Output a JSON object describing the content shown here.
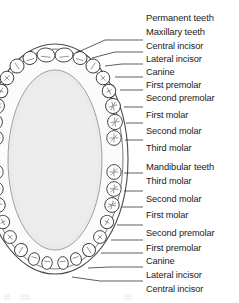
{
  "figure": {
    "type": "dental-arch-occlusal-diagram",
    "palate_fill": "#eaeaea",
    "tooth_fill": "#ffffff",
    "outline_color": "#3a3a3a",
    "text_color": "#1a1a1a",
    "leader_color": "#2a2a2a"
  },
  "labels": [
    {
      "id": "permanent-teeth",
      "text": "Permanent teeth",
      "x": 146,
      "y": 13,
      "group": true,
      "leader": false
    },
    {
      "id": "maxillary-teeth",
      "text": "Maxillary teeth",
      "x": 146,
      "y": 27,
      "group": true,
      "leader": false
    },
    {
      "id": "max-central-incisor",
      "text": "Central incisor",
      "x": 146,
      "y": 41,
      "group": false,
      "leader": true
    },
    {
      "id": "max-lateral-incisor",
      "text": "Lateral incisor",
      "x": 146,
      "y": 54,
      "group": false,
      "leader": true
    },
    {
      "id": "max-canine",
      "text": "Canine",
      "x": 146,
      "y": 67,
      "group": false,
      "leader": true
    },
    {
      "id": "max-first-premolar",
      "text": "First premolar",
      "x": 146,
      "y": 80,
      "group": false,
      "leader": true
    },
    {
      "id": "max-second-premolar",
      "text": "Second premolar",
      "x": 146,
      "y": 93,
      "group": false,
      "leader": true
    },
    {
      "id": "max-first-molar",
      "text": "First molar",
      "x": 146,
      "y": 110,
      "group": false,
      "leader": true
    },
    {
      "id": "max-second-molar",
      "text": "Second molar",
      "x": 146,
      "y": 126,
      "group": false,
      "leader": true
    },
    {
      "id": "max-third-molar",
      "text": "Third molar",
      "x": 146,
      "y": 143,
      "group": false,
      "leader": true
    },
    {
      "id": "mandibular-teeth",
      "text": "Mandibular teeth",
      "x": 146,
      "y": 162,
      "group": true,
      "leader": false
    },
    {
      "id": "man-third-molar",
      "text": "Third molar",
      "x": 146,
      "y": 176,
      "group": false,
      "leader": true
    },
    {
      "id": "man-second-molar",
      "text": "Second molar",
      "x": 146,
      "y": 194,
      "group": false,
      "leader": true
    },
    {
      "id": "man-first-molar",
      "text": "First molar",
      "x": 146,
      "y": 210,
      "group": false,
      "leader": true
    },
    {
      "id": "man-second-premolar",
      "text": "Second premolar",
      "x": 146,
      "y": 228,
      "group": false,
      "leader": true
    },
    {
      "id": "man-first-premolar",
      "text": "First premolar",
      "x": 146,
      "y": 243,
      "group": false,
      "leader": true
    },
    {
      "id": "man-canine",
      "text": "Canine",
      "x": 146,
      "y": 256,
      "group": false,
      "leader": true
    },
    {
      "id": "man-lateral-incisor",
      "text": "Lateral incisor",
      "x": 146,
      "y": 270,
      "group": false,
      "leader": true
    },
    {
      "id": "man-central-incisor",
      "text": "Central incisor",
      "x": 146,
      "y": 284,
      "group": false,
      "leader": true
    }
  ],
  "leader_lines": [
    {
      "id": "leader-max-central-incisor",
      "x1": 76,
      "y1": 53,
      "x2": 105,
      "y2": 40,
      "x3": 143,
      "y3": 40
    },
    {
      "id": "leader-max-lateral-incisor",
      "x1": 92,
      "y1": 58,
      "x2": 115,
      "y2": 52,
      "x3": 143,
      "y3": 52
    },
    {
      "id": "leader-max-canine",
      "x1": 105,
      "y1": 66,
      "x2": 122,
      "y2": 64,
      "x3": 143,
      "y3": 64
    },
    {
      "id": "leader-max-first-premolar",
      "x1": 115,
      "y1": 77,
      "x2": 130,
      "y2": 77,
      "x3": 143,
      "y3": 77
    },
    {
      "id": "leader-max-second-premolar",
      "x1": 120,
      "y1": 90,
      "x2": 133,
      "y2": 90,
      "x3": 143,
      "y3": 90
    },
    {
      "id": "leader-max-first-molar",
      "x1": 124,
      "y1": 107,
      "x2": 134,
      "y2": 107,
      "x3": 143,
      "y3": 107
    },
    {
      "id": "leader-max-second-molar",
      "x1": 126,
      "y1": 123,
      "x2": 134,
      "y2": 123,
      "x3": 143,
      "y3": 123
    },
    {
      "id": "leader-max-third-molar",
      "x1": 125,
      "y1": 140,
      "x2": 134,
      "y2": 140,
      "x3": 143,
      "y3": 140
    },
    {
      "id": "leader-man-third-molar",
      "x1": 124,
      "y1": 173,
      "x2": 134,
      "y2": 173,
      "x3": 143,
      "y3": 173
    },
    {
      "id": "leader-man-second-molar",
      "x1": 124,
      "y1": 191,
      "x2": 134,
      "y2": 191,
      "x3": 143,
      "y3": 191
    },
    {
      "id": "leader-man-first-molar",
      "x1": 122,
      "y1": 207,
      "x2": 134,
      "y2": 207,
      "x3": 143,
      "y3": 207
    },
    {
      "id": "leader-man-second-premolar",
      "x1": 117,
      "y1": 225,
      "x2": 132,
      "y2": 225,
      "x3": 143,
      "y3": 225
    },
    {
      "id": "leader-man-first-premolar",
      "x1": 111,
      "y1": 240,
      "x2": 128,
      "y2": 240,
      "x3": 143,
      "y3": 240
    },
    {
      "id": "leader-man-canine",
      "x1": 101,
      "y1": 253,
      "x2": 120,
      "y2": 253,
      "x3": 143,
      "y3": 253
    },
    {
      "id": "leader-man-lateral-incisor",
      "x1": 88,
      "y1": 268,
      "x2": 110,
      "y2": 267,
      "x3": 143,
      "y3": 267
    },
    {
      "id": "leader-man-central-incisor",
      "x1": 72,
      "y1": 277,
      "x2": 100,
      "y2": 281,
      "x3": 143,
      "y3": 281
    }
  ],
  "teeth": {
    "maxillary_right": [
      {
        "id": "tooth-max-r-central-incisor",
        "cx": 64,
        "cy": 55,
        "rx": 9.0,
        "ry": 7.0,
        "rot": -6,
        "type": "incisor"
      },
      {
        "id": "tooth-max-r-lateral-incisor",
        "cx": 80,
        "cy": 58,
        "rx": 7.0,
        "ry": 6.5,
        "rot": 16,
        "type": "incisor"
      },
      {
        "id": "tooth-max-r-canine",
        "cx": 93,
        "cy": 66,
        "rx": 7.0,
        "ry": 7.0,
        "rot": 33,
        "type": "canine"
      },
      {
        "id": "tooth-max-r-first-premolar",
        "cx": 103,
        "cy": 78,
        "rx": 6.8,
        "ry": 6.8,
        "rot": 48,
        "type": "premolar"
      },
      {
        "id": "tooth-max-r-second-premolar",
        "cx": 109,
        "cy": 91,
        "rx": 6.8,
        "ry": 6.8,
        "rot": 62,
        "type": "premolar"
      },
      {
        "id": "tooth-max-r-first-molar",
        "cx": 113,
        "cy": 106,
        "rx": 7.6,
        "ry": 7.4,
        "rot": 74,
        "type": "molar"
      },
      {
        "id": "tooth-max-r-second-molar",
        "cx": 115,
        "cy": 122,
        "rx": 7.6,
        "ry": 7.4,
        "rot": 83,
        "type": "molar"
      },
      {
        "id": "tooth-max-r-third-molar",
        "cx": 114,
        "cy": 138,
        "rx": 7.4,
        "ry": 7.2,
        "rot": 90,
        "type": "molar"
      }
    ],
    "maxillary_left": [
      {
        "id": "tooth-max-l-central-incisor",
        "cx": 46,
        "cy": 55,
        "rx": 9.0,
        "ry": 7.0,
        "rot": 6,
        "type": "incisor"
      },
      {
        "id": "tooth-max-l-lateral-incisor",
        "cx": 30,
        "cy": 58,
        "rx": 7.0,
        "ry": 6.5,
        "rot": -16,
        "type": "incisor"
      },
      {
        "id": "tooth-max-l-canine",
        "cx": 17,
        "cy": 66,
        "rx": 7.0,
        "ry": 7.0,
        "rot": -33,
        "type": "canine"
      },
      {
        "id": "tooth-max-l-first-premolar",
        "cx": 7,
        "cy": 78,
        "rx": 6.8,
        "ry": 6.8,
        "rot": -48,
        "type": "premolar"
      },
      {
        "id": "tooth-max-l-second-premolar",
        "cx": 1,
        "cy": 91,
        "rx": 6.8,
        "ry": 6.8,
        "rot": -62,
        "type": "premolar"
      },
      {
        "id": "tooth-max-l-first-molar",
        "cx": -3,
        "cy": 106,
        "rx": 7.6,
        "ry": 7.4,
        "rot": -74,
        "type": "molar"
      },
      {
        "id": "tooth-max-l-second-molar",
        "cx": -5,
        "cy": 122,
        "rx": 7.6,
        "ry": 7.4,
        "rot": -83,
        "type": "molar"
      },
      {
        "id": "tooth-max-l-third-molar",
        "cx": -4,
        "cy": 138,
        "rx": 7.4,
        "ry": 7.2,
        "rot": -90,
        "type": "molar"
      }
    ],
    "mandibular_right": [
      {
        "id": "tooth-man-r-third-molar",
        "cx": 114,
        "cy": 172,
        "rx": 7.4,
        "ry": 7.2,
        "rot": 90,
        "type": "molar"
      },
      {
        "id": "tooth-man-r-second-molar",
        "cx": 114,
        "cy": 189,
        "rx": 7.4,
        "ry": 7.2,
        "rot": 96,
        "type": "molar"
      },
      {
        "id": "tooth-man-r-first-molar",
        "cx": 112,
        "cy": 205,
        "rx": 7.4,
        "ry": 7.2,
        "rot": 106,
        "type": "molar"
      },
      {
        "id": "tooth-man-r-second-premolar",
        "cx": 107,
        "cy": 222,
        "rx": 6.6,
        "ry": 6.6,
        "rot": 119,
        "type": "premolar"
      },
      {
        "id": "tooth-man-r-first-premolar",
        "cx": 100,
        "cy": 237,
        "rx": 6.4,
        "ry": 6.4,
        "rot": 133,
        "type": "premolar"
      },
      {
        "id": "tooth-man-r-canine",
        "cx": 89,
        "cy": 250,
        "rx": 6.4,
        "ry": 6.6,
        "rot": 148,
        "type": "canine"
      },
      {
        "id": "tooth-man-r-lateral-incisor",
        "cx": 76,
        "cy": 259,
        "rx": 5.4,
        "ry": 6.4,
        "rot": 163,
        "type": "incisor"
      },
      {
        "id": "tooth-man-r-central-incisor",
        "cx": 63,
        "cy": 263,
        "rx": 5.2,
        "ry": 6.4,
        "rot": 173,
        "type": "incisor"
      }
    ],
    "mandibular_left": [
      {
        "id": "tooth-man-l-third-molar",
        "cx": -4,
        "cy": 172,
        "rx": 7.4,
        "ry": 7.2,
        "rot": -90,
        "type": "molar"
      },
      {
        "id": "tooth-man-l-second-molar",
        "cx": -4,
        "cy": 189,
        "rx": 7.4,
        "ry": 7.2,
        "rot": -96,
        "type": "molar"
      },
      {
        "id": "tooth-man-l-first-molar",
        "cx": -2,
        "cy": 205,
        "rx": 7.4,
        "ry": 7.2,
        "rot": -106,
        "type": "molar"
      },
      {
        "id": "tooth-man-l-second-premolar",
        "cx": 3,
        "cy": 222,
        "rx": 6.6,
        "ry": 6.6,
        "rot": -119,
        "type": "premolar"
      },
      {
        "id": "tooth-man-l-first-premolar",
        "cx": 10,
        "cy": 237,
        "rx": 6.4,
        "ry": 6.4,
        "rot": -133,
        "type": "premolar"
      },
      {
        "id": "tooth-man-l-canine",
        "cx": 21,
        "cy": 250,
        "rx": 6.4,
        "ry": 6.6,
        "rot": -148,
        "type": "canine"
      },
      {
        "id": "tooth-man-l-lateral-incisor",
        "cx": 34,
        "cy": 259,
        "rx": 5.4,
        "ry": 6.4,
        "rot": -163,
        "type": "incisor"
      },
      {
        "id": "tooth-man-l-central-incisor",
        "cx": 47,
        "cy": 263,
        "rx": 5.2,
        "ry": 6.4,
        "rot": -173,
        "type": "incisor"
      }
    ]
  }
}
